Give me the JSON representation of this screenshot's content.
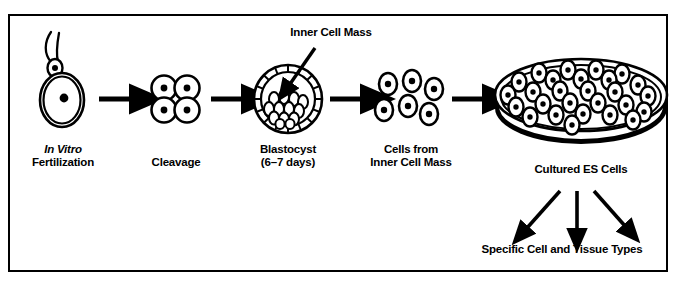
{
  "figure": {
    "caption": "",
    "border_color": "#000000",
    "ink_color": "#000000",
    "background": "#ffffff"
  },
  "diagram": {
    "type": "flow",
    "stages": [
      {
        "id": "fertilization",
        "label_line1": "In Vitro",
        "label_line2": "Fertilization",
        "italic_line1": true,
        "icon": "sperm-and-egg-icon"
      },
      {
        "id": "cleavage",
        "label_line1": "Cleavage",
        "label_line2": "",
        "italic_line1": false,
        "icon": "four-cell-embryo-icon"
      },
      {
        "id": "blastocyst",
        "label_line1": "Blastocyst",
        "label_line2": "(6–7 days)",
        "italic_line1": false,
        "icon": "blastocyst-icon"
      },
      {
        "id": "icm-cells",
        "label_line1": "Cells from",
        "label_line2": "Inner Cell Mass",
        "italic_line1": false,
        "icon": "dissociated-cells-icon"
      },
      {
        "id": "cultured",
        "label_line1": "Cultured ES Cells",
        "label_line2": "",
        "italic_line1": false,
        "icon": "petri-dish-icon"
      }
    ],
    "callout": {
      "id": "inner-cell-mass",
      "label": "Inner Cell Mass"
    },
    "outcome": {
      "id": "tissue-types",
      "label": "Specific Cell and Tissue Types"
    },
    "arrows_between_stages": 4,
    "differentiation_arrows": 3,
    "counts": {
      "cleavage_cells": 4,
      "icm_loose_cells": 6,
      "petri_dish_cells": 27
    }
  }
}
